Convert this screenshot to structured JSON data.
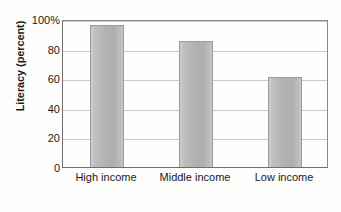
{
  "chart_data": {
    "type": "bar",
    "title": "",
    "subtitle": "",
    "xlabel": "",
    "ylabel": "Literacy (percent)",
    "categories": [
      "High income",
      "Middle income",
      "Low income"
    ],
    "values": [
      96,
      85,
      61
    ],
    "ylim": [
      0,
      100
    ],
    "yticks": [
      0,
      20,
      40,
      60,
      80,
      100
    ],
    "ytick_labels": [
      "0",
      "20",
      "40",
      "60",
      "80",
      "100%"
    ],
    "grid": true,
    "legend": false,
    "legend_position": "none",
    "series": [
      {
        "name": "Literacy",
        "values": [
          96,
          85,
          61
        ]
      }
    ],
    "colors": {
      "bar_fill": "#b2b2b2",
      "bar_edge": "#9a9a9a",
      "gridline": "#c9c9c9",
      "axis": "#6e6e6e",
      "text": "#1a1a1a",
      "background": "#fdfdfc"
    }
  },
  "axis": {
    "y_title": "Literacy (percent)",
    "y_ticks": [
      {
        "label": "100%",
        "value": 100
      },
      {
        "label": "80",
        "value": 80
      },
      {
        "label": "60",
        "value": 60
      },
      {
        "label": "40",
        "value": 40
      },
      {
        "label": "20",
        "value": 20
      },
      {
        "label": "0",
        "value": 0
      }
    ],
    "x_ticks": [
      {
        "label": "High income"
      },
      {
        "label": "Middle income"
      },
      {
        "label": "Low income"
      }
    ]
  }
}
